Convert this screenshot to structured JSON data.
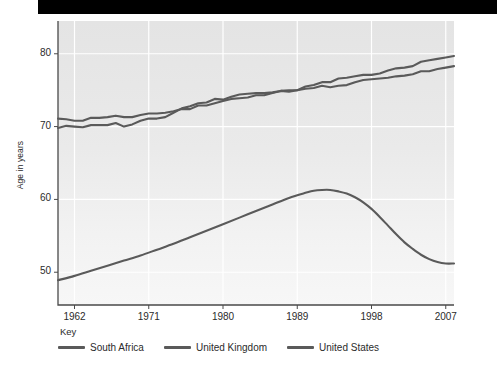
{
  "banner": {
    "name": "top-black-bar",
    "color": "#000000"
  },
  "chart_data": {
    "type": "line",
    "title": "",
    "subtitle": "",
    "xlabel": "",
    "ylabel": "Age in years",
    "xlim": [
      1960,
      2008
    ],
    "ylim": [
      45.5,
      84.5
    ],
    "grid": true,
    "grid_color": "#ffffff",
    "plot_background": "#e6e6e6",
    "legend_title": "Key",
    "legend_position": "below-left",
    "y_ticks": [
      50,
      60,
      70,
      80
    ],
    "y_tick_labels": [
      "50",
      "60",
      "70",
      "80"
    ],
    "x_ticks": [
      1962,
      1971,
      1980,
      1989,
      1998,
      2007
    ],
    "x_tick_labels": [
      "1962",
      "1971",
      "1980",
      "1989",
      "1998",
      "2007"
    ],
    "series": [
      {
        "name": "South Africa",
        "color": "#5a5a5a",
        "x": [
          1960,
          1962,
          1964,
          1966,
          1968,
          1970,
          1972,
          1974,
          1976,
          1978,
          1980,
          1982,
          1984,
          1986,
          1988,
          1990,
          1991,
          1992,
          1993,
          1994,
          1995,
          1996,
          1997,
          1998,
          1999,
          2000,
          2001,
          2002,
          2003,
          2004,
          2005,
          2006,
          2007,
          2008
        ],
        "values": [
          48.9,
          49.5,
          50.2,
          50.9,
          51.6,
          52.3,
          53.1,
          53.9,
          54.8,
          55.7,
          56.6,
          57.5,
          58.4,
          59.3,
          60.2,
          60.9,
          61.2,
          61.3,
          61.3,
          61.1,
          60.8,
          60.3,
          59.6,
          58.7,
          57.6,
          56.4,
          55.2,
          54.1,
          53.2,
          52.4,
          51.8,
          51.4,
          51.2,
          51.2
        ]
      },
      {
        "name": "United Kingdom",
        "color": "#5a5a5a",
        "x": [
          1960,
          1961,
          1962,
          1963,
          1964,
          1965,
          1966,
          1967,
          1968,
          1969,
          1970,
          1971,
          1972,
          1973,
          1974,
          1975,
          1976,
          1977,
          1978,
          1979,
          1980,
          1981,
          1982,
          1983,
          1984,
          1985,
          1986,
          1987,
          1988,
          1989,
          1990,
          1991,
          1992,
          1993,
          1994,
          1995,
          1996,
          1997,
          1998,
          1999,
          2000,
          2001,
          2002,
          2003,
          2004,
          2005,
          2006,
          2007,
          2008
        ],
        "values": [
          71.1,
          71.0,
          70.8,
          70.8,
          71.2,
          71.2,
          71.3,
          71.5,
          71.3,
          71.3,
          71.6,
          71.8,
          71.8,
          71.9,
          72.1,
          72.4,
          72.4,
          72.9,
          72.9,
          73.2,
          73.5,
          73.8,
          73.9,
          74.0,
          74.3,
          74.3,
          74.6,
          74.9,
          75.0,
          75.0,
          75.5,
          75.7,
          76.1,
          76.1,
          76.6,
          76.7,
          76.9,
          77.1,
          77.1,
          77.3,
          77.7,
          78.0,
          78.1,
          78.3,
          78.9,
          79.1,
          79.3,
          79.5,
          79.7
        ]
      },
      {
        "name": "United States",
        "color": "#5a5a5a",
        "x": [
          1960,
          1961,
          1962,
          1963,
          1964,
          1965,
          1966,
          1967,
          1968,
          1969,
          1970,
          1971,
          1972,
          1973,
          1974,
          1975,
          1976,
          1977,
          1978,
          1979,
          1980,
          1981,
          1982,
          1983,
          1984,
          1985,
          1986,
          1987,
          1988,
          1989,
          1990,
          1991,
          1992,
          1993,
          1994,
          1995,
          1996,
          1997,
          1998,
          1999,
          2000,
          2001,
          2002,
          2003,
          2004,
          2005,
          2006,
          2007,
          2008
        ],
        "values": [
          69.8,
          70.1,
          70.0,
          69.9,
          70.2,
          70.2,
          70.2,
          70.5,
          70.0,
          70.3,
          70.8,
          71.1,
          71.1,
          71.3,
          71.9,
          72.5,
          72.8,
          73.2,
          73.3,
          73.8,
          73.7,
          74.1,
          74.4,
          74.5,
          74.6,
          74.6,
          74.7,
          74.9,
          74.8,
          75.0,
          75.2,
          75.3,
          75.6,
          75.4,
          75.6,
          75.7,
          76.1,
          76.4,
          76.5,
          76.6,
          76.7,
          76.9,
          77.0,
          77.2,
          77.6,
          77.6,
          77.9,
          78.1,
          78.3
        ]
      }
    ]
  },
  "legend": {
    "title": "Key",
    "items": [
      {
        "label": "South Africa",
        "color": "#5a5a5a"
      },
      {
        "label": "United Kingdom",
        "color": "#5a5a5a"
      },
      {
        "label": "United States",
        "color": "#5a5a5a"
      }
    ]
  }
}
